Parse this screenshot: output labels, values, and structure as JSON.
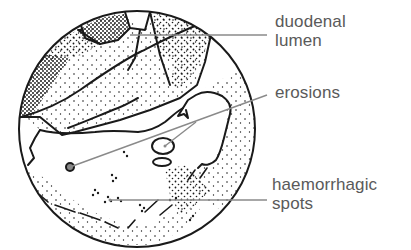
{
  "figure": {
    "type": "endoscopic view illustration",
    "colors": {
      "outline": "#1a1a1a",
      "leader_line": "#8a8a8a",
      "label_text": "#5a5a5a",
      "background": "#ffffff"
    }
  },
  "labels": [
    {
      "id": "duodenal-lumen",
      "lines": [
        "duodenal",
        "lumen"
      ]
    },
    {
      "id": "erosions",
      "lines": [
        "erosions"
      ]
    },
    {
      "id": "haemorrhagic-spots",
      "lines": [
        "haemorrhagic",
        "spots"
      ]
    }
  ]
}
